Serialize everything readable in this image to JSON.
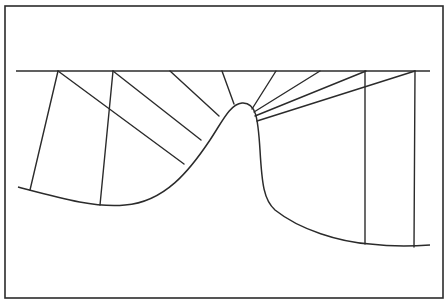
{
  "diagram": {
    "title": "",
    "stroke_color": "#2b2b2b",
    "background": "#ffffff",
    "frame": {
      "x": 5,
      "y": 6,
      "width": 438,
      "height": 292
    },
    "reference_line": {
      "x1": 16,
      "y1": 71,
      "x2": 430,
      "y2": 71
    },
    "surface_curve": "M 18 187 C 60 198, 95 208, 125 205 C 165 202, 190 170, 210 140 C 222 122, 230 104, 242 103 C 256 102, 258 118, 260 150 C 262 185, 264 200, 275 210 C 300 230, 340 242, 370 244 C 395 247, 415 246, 430 245",
    "rays": [
      {
        "x1": 58,
        "y1": 71,
        "x2": 30,
        "y2": 190
      },
      {
        "x1": 58,
        "y1": 71,
        "x2": 184,
        "y2": 164
      },
      {
        "x1": 113,
        "y1": 71,
        "x2": 100,
        "y2": 205
      },
      {
        "x1": 113,
        "y1": 71,
        "x2": 201,
        "y2": 140
      },
      {
        "x1": 170,
        "y1": 71,
        "x2": 219,
        "y2": 116
      },
      {
        "x1": 222,
        "y1": 71,
        "x2": 234,
        "y2": 104
      },
      {
        "x1": 276,
        "y1": 71,
        "x2": 252,
        "y2": 109
      },
      {
        "x1": 320,
        "y1": 71,
        "x2": 254,
        "y2": 112
      },
      {
        "x1": 366,
        "y1": 71,
        "x2": 255,
        "y2": 116
      },
      {
        "x1": 415,
        "y1": 71,
        "x2": 257,
        "y2": 121
      },
      {
        "x1": 365,
        "y1": 71,
        "x2": 365,
        "y2": 244
      },
      {
        "x1": 415,
        "y1": 71,
        "x2": 414,
        "y2": 247
      }
    ]
  }
}
